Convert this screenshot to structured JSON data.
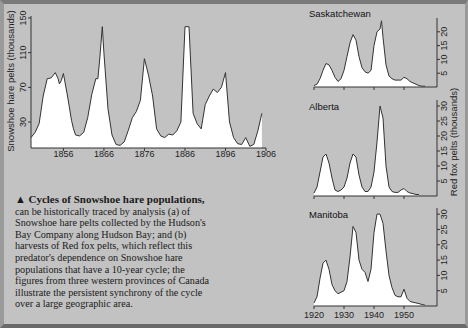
{
  "caption": {
    "marker": "▲",
    "heading": "Cycles of Snowshoe hare populations,",
    "body": "can be historically traced by analysis (a) of Snowshoe hare pelts collected by the Hudson's Bay Company along Hudson Bay; and (b) harvests of Red fox pelts, which reflect this predator's dependence on Snowshoe hare populations that have a 10-year cycle; the figures from three western provinces of Canada illustrate the persistent synchrony of the cycle over a large geographic area."
  },
  "colors": {
    "background": "#c2c2c2",
    "fill": "#ffffff",
    "line": "#333333"
  },
  "chart_data": [
    {
      "type": "area",
      "id": "hare",
      "title": "",
      "ylabel": "Snowshoe hare pelts (thousands)",
      "xlabel": "",
      "xlim": [
        1848,
        1906
      ],
      "ylim": [
        0,
        150
      ],
      "xticks": [
        1856,
        1866,
        1876,
        1886,
        1896,
        1906
      ],
      "yticks": [
        30,
        70,
        110,
        150
      ],
      "x": [
        1848,
        1849,
        1850,
        1851,
        1852,
        1853,
        1854,
        1854.7,
        1855,
        1855.5,
        1856,
        1857,
        1858,
        1858.5,
        1859,
        1860,
        1861,
        1862,
        1863,
        1864,
        1864.5,
        1865,
        1865.6,
        1866,
        1867,
        1868,
        1869,
        1870,
        1871,
        1872,
        1873,
        1874,
        1875,
        1876,
        1877,
        1878,
        1879,
        1880,
        1881,
        1882,
        1883,
        1884,
        1885,
        1886,
        1887,
        1888,
        1889,
        1890,
        1891,
        1892,
        1893,
        1894,
        1895,
        1896,
        1897,
        1898,
        1899,
        1900,
        1901,
        1902,
        1903,
        1904,
        1905
      ],
      "y": [
        12,
        18,
        28,
        60,
        80,
        81,
        87,
        80,
        74,
        78,
        86,
        60,
        32,
        22,
        15,
        14,
        18,
        35,
        62,
        80,
        80,
        105,
        140,
        110,
        45,
        15,
        4,
        3,
        7,
        20,
        35,
        42,
        55,
        103,
        84,
        60,
        22,
        14,
        12,
        16,
        15,
        20,
        30,
        140,
        140,
        40,
        28,
        22,
        50,
        60,
        68,
        64,
        70,
        87,
        30,
        12,
        5,
        4,
        12,
        2,
        4,
        20,
        40
      ]
    },
    {
      "type": "area",
      "id": "saskatchewan",
      "title": "Saskatchewan",
      "xlim": [
        1920,
        1957
      ],
      "ylim": [
        0,
        25
      ],
      "yticks": [
        5,
        10,
        15,
        20
      ],
      "x": [
        1920,
        1921,
        1922,
        1923,
        1924,
        1925,
        1926,
        1927,
        1928,
        1929,
        1930,
        1931,
        1932,
        1933,
        1934,
        1935,
        1936,
        1937,
        1938,
        1939,
        1940,
        1941,
        1942,
        1942.5,
        1943,
        1944,
        1945,
        1946,
        1947,
        1948,
        1949,
        1950,
        1951,
        1952,
        1953,
        1954,
        1955,
        1956,
        1957
      ],
      "y": [
        0.5,
        1,
        3,
        6,
        8.5,
        8,
        6,
        3.5,
        2,
        3,
        6,
        11,
        16,
        19,
        17,
        11,
        7,
        5.5,
        5,
        6,
        15,
        20,
        21,
        24,
        18,
        8,
        4,
        3,
        2.5,
        2.5,
        2.5,
        3.5,
        3,
        2,
        1.5,
        1,
        0.5,
        0.3,
        0.3
      ]
    },
    {
      "type": "area",
      "id": "alberta",
      "title": "Alberta",
      "xlim": [
        1920,
        1957
      ],
      "ylim": [
        0,
        32
      ],
      "yticks": [
        5,
        10,
        15,
        20,
        25,
        30
      ],
      "ylabel": "Red fox pelts (thousands)",
      "x": [
        1920,
        1921,
        1922,
        1923,
        1924,
        1925,
        1926,
        1927,
        1928,
        1929,
        1930,
        1931,
        1932,
        1933,
        1934,
        1935,
        1936,
        1937,
        1938,
        1939,
        1940,
        1941,
        1942,
        1943,
        1944,
        1945,
        1946,
        1947,
        1948,
        1949,
        1950,
        1951,
        1952,
        1953,
        1954,
        1955
      ],
      "y": [
        1,
        3,
        8,
        13,
        14,
        11,
        6,
        2,
        1.5,
        2,
        3,
        6,
        11,
        14,
        13,
        7,
        3,
        1.5,
        1.5,
        3,
        8,
        18,
        30,
        26,
        10,
        3,
        1.5,
        1.2,
        1.2,
        2,
        2.5,
        1.5,
        1,
        0.8,
        0.5,
        0.5
      ]
    },
    {
      "type": "area",
      "id": "manitoba",
      "title": "Manitoba",
      "xlim": [
        1920,
        1957
      ],
      "ylim": [
        0,
        32
      ],
      "xticks": [
        1920,
        1930,
        1940,
        1950
      ],
      "yticks": [
        5,
        10,
        15,
        20,
        25,
        30
      ],
      "x": [
        1920,
        1921,
        1922,
        1923,
        1924,
        1925,
        1926,
        1927,
        1928,
        1929,
        1930,
        1931,
        1932,
        1933,
        1934,
        1935,
        1936,
        1937,
        1938,
        1939,
        1940,
        1941,
        1942,
        1943,
        1944,
        1945,
        1946,
        1947,
        1948,
        1949,
        1950,
        1951,
        1952,
        1953,
        1954,
        1955,
        1956,
        1957
      ],
      "y": [
        1,
        3,
        9,
        14,
        15,
        12,
        7,
        5,
        4,
        4.5,
        5,
        8,
        16,
        26,
        24,
        15,
        12,
        11,
        8,
        12,
        24,
        30,
        30,
        27,
        18,
        10,
        6,
        3.5,
        3,
        3,
        5.5,
        2.5,
        1.5,
        1.2,
        1,
        0.8,
        0.5,
        0.3
      ]
    }
  ]
}
